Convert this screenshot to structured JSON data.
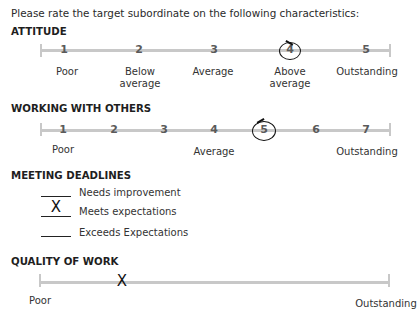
{
  "intro": "Please rate the target subordinate on the following characteristics:",
  "sections": {
    "attitude": {
      "heading": "ATTITUDE",
      "ticks": [
        "1",
        "2",
        "3",
        "4",
        "5"
      ],
      "labels": [
        "Poor",
        "Below\naverage",
        "Average",
        "Above\naverage",
        "Outstanding"
      ],
      "selected": "4"
    },
    "working": {
      "heading": "WORKING WITH OTHERS",
      "ticks": [
        "1",
        "2",
        "3",
        "4",
        "5",
        "6",
        "7"
      ],
      "labels": {
        "poor": "Poor",
        "average": "Average",
        "outstanding": "Outstanding"
      },
      "selected": "5"
    },
    "deadlines": {
      "heading": "MEETING DEADLINES",
      "options": [
        {
          "label": "Needs improvement",
          "mark": ""
        },
        {
          "label": "Meets expectations",
          "mark": "X"
        },
        {
          "label": "Exceeds Expectations",
          "mark": ""
        }
      ]
    },
    "quality": {
      "heading": "QUALITY OF WORK",
      "labels": {
        "poor": "Poor",
        "outstanding": "Outstanding"
      },
      "mark": "X"
    }
  }
}
